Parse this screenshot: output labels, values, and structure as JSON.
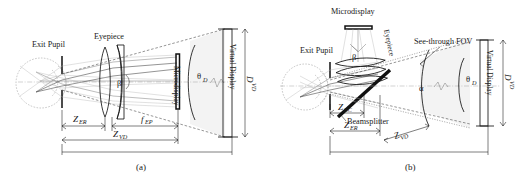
{
  "figure": {
    "background_color": "#ffffff",
    "ink_color": "#1a1a1a",
    "panels": [
      {
        "id": "a",
        "caption": "(a)",
        "labels": {
          "exit_pupil": "Exit Pupil",
          "eyepiece": "Eyepiece",
          "microdisplay": "Microdisplay",
          "virtual_display": "Virtual Display"
        },
        "symbols": {
          "beta": "β",
          "theta_d_greek": "θ",
          "theta_d_sub": "D",
          "d_vd_main": "D",
          "d_vd_sub": "VD",
          "z_er_main": "Z",
          "z_er_sub": "ER",
          "f_ep_main": "f",
          "f_ep_sub": "EP",
          "z_vd_main": "Z",
          "z_vd_sub": "VD"
        }
      },
      {
        "id": "b",
        "caption": "(b)",
        "labels": {
          "exit_pupil": "Exit Pupil",
          "eyepiece": "Eyepiece",
          "microdisplay": "Microdisplay",
          "see_through_fov": "See-through FOV",
          "beamsplitter": "Beamsplitter",
          "virtual_display": "Virtual Display"
        },
        "symbols": {
          "beta": "β",
          "alpha": "α",
          "theta_d_greek": "θ",
          "theta_d_sub": "D",
          "d_vd_main": "D",
          "d_vd_sub": "VD",
          "z_ec_main": "Z",
          "z_ec_sub": "EC",
          "z_er_main": "Z",
          "z_er_sub": "ER",
          "z_vd_main": "Z",
          "z_vd_sub": "VD"
        }
      }
    ]
  }
}
